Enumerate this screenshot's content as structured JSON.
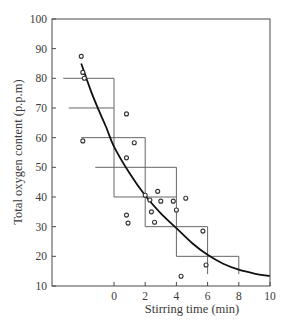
{
  "chart_data": {
    "type": "scatter",
    "title": "",
    "xlabel": "Stirring time (min)",
    "ylabel": "Total oxygen content (p.p.m)",
    "xlim": [
      -3.9,
      10
    ],
    "ylim": [
      10,
      100
    ],
    "x_ticks": [
      0,
      2,
      4,
      6,
      8,
      10
    ],
    "y_ticks": [
      10,
      20,
      30,
      40,
      50,
      60,
      70,
      80,
      90,
      100
    ],
    "grid": false,
    "legend": null,
    "series": [
      {
        "name": "Measured oxygen content",
        "kind": "scatter",
        "marker": "open-circle",
        "points": [
          {
            "x": -2.1,
            "y": 87.4
          },
          {
            "x": -2.0,
            "y": 82.0
          },
          {
            "x": -1.9,
            "y": 80.0
          },
          {
            "x": -2.0,
            "y": 58.9
          },
          {
            "x": 0.8,
            "y": 68.0
          },
          {
            "x": 1.3,
            "y": 58.3
          },
          {
            "x": 0.8,
            "y": 53.2
          },
          {
            "x": 0.8,
            "y": 33.9
          },
          {
            "x": 0.9,
            "y": 31.2
          },
          {
            "x": 2.0,
            "y": 40.6
          },
          {
            "x": 2.8,
            "y": 41.9
          },
          {
            "x": 2.3,
            "y": 39.0
          },
          {
            "x": 3.0,
            "y": 38.6
          },
          {
            "x": 3.8,
            "y": 38.6
          },
          {
            "x": 4.6,
            "y": 39.6
          },
          {
            "x": 2.4,
            "y": 35.0
          },
          {
            "x": 4.0,
            "y": 35.6
          },
          {
            "x": 2.6,
            "y": 31.5
          },
          {
            "x": 5.7,
            "y": 28.5
          },
          {
            "x": 5.9,
            "y": 17.1
          },
          {
            "x": 4.3,
            "y": 13.3
          }
        ]
      },
      {
        "name": "Fitted decay curve",
        "kind": "line",
        "points": [
          {
            "x": -2.1,
            "y": 85.0
          },
          {
            "x": -1.5,
            "y": 76.0
          },
          {
            "x": -1.0,
            "y": 69.5
          },
          {
            "x": -0.5,
            "y": 63.5
          },
          {
            "x": 0,
            "y": 57.0
          },
          {
            "x": 1,
            "y": 48.0
          },
          {
            "x": 2,
            "y": 40.5
          },
          {
            "x": 3,
            "y": 34.5
          },
          {
            "x": 4,
            "y": 29.5
          },
          {
            "x": 5,
            "y": 24.5
          },
          {
            "x": 6,
            "y": 20.5
          },
          {
            "x": 7,
            "y": 17.5
          },
          {
            "x": 8,
            "y": 15.5
          },
          {
            "x": 9,
            "y": 14.2
          },
          {
            "x": 10,
            "y": 13.3
          }
        ]
      }
    ],
    "step_boxes": [
      {
        "y_top": 80,
        "x_left": -3.25,
        "x_right": 0
      },
      {
        "y_top": 70,
        "x_left": -2.9,
        "x_right": 0
      },
      {
        "y_top": 60,
        "x_left": -2.1,
        "x_right": 2
      },
      {
        "y_top": 50,
        "x_left": -1.2,
        "x_right": 4
      },
      {
        "y_top": 40,
        "x_left": 0,
        "x_right": 4
      },
      {
        "y_top": 30,
        "x_left": 2,
        "x_right": 6
      },
      {
        "y_top": 20,
        "x_left": 4,
        "x_right": 8
      }
    ],
    "step_verticals": [
      {
        "x": 0,
        "y_from": 80,
        "y_to": 40
      },
      {
        "x": 2,
        "y_from": 60,
        "y_to": 30
      },
      {
        "x": 4,
        "y_from": 50,
        "y_to": 20
      },
      {
        "x": 6,
        "y_from": 30,
        "y_to": 14
      },
      {
        "x": 8,
        "y_from": 20,
        "y_to": 14
      }
    ]
  },
  "colors": {
    "axis": "#4a4a4a",
    "curve": "#111111",
    "steps": "#666666",
    "marker": "#333333",
    "text": "#3a3a3a"
  }
}
